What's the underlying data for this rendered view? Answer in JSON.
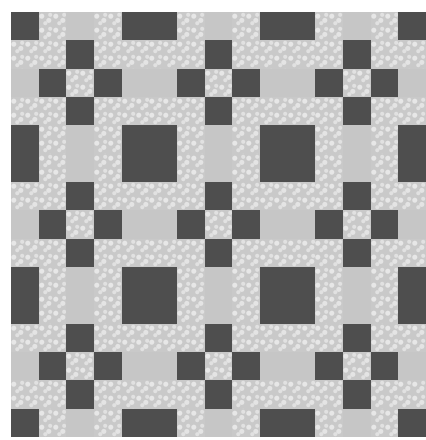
{
  "image": {
    "subject": "quilt pattern",
    "description": "Grayscale quilt with dark square blocks and nine-patch cross motifs on speckled light fabric",
    "grid": {
      "columns": 15,
      "rows": 15
    },
    "colors": {
      "dark": "#4e4e4e",
      "light": "#c9c9c9",
      "plain": "#c6c6c6",
      "background": "#ffffff"
    },
    "big_block_rows_cols": [
      0,
      4,
      5,
      9,
      10,
      14
    ],
    "cross_centers": [
      2,
      7,
      12
    ]
  }
}
